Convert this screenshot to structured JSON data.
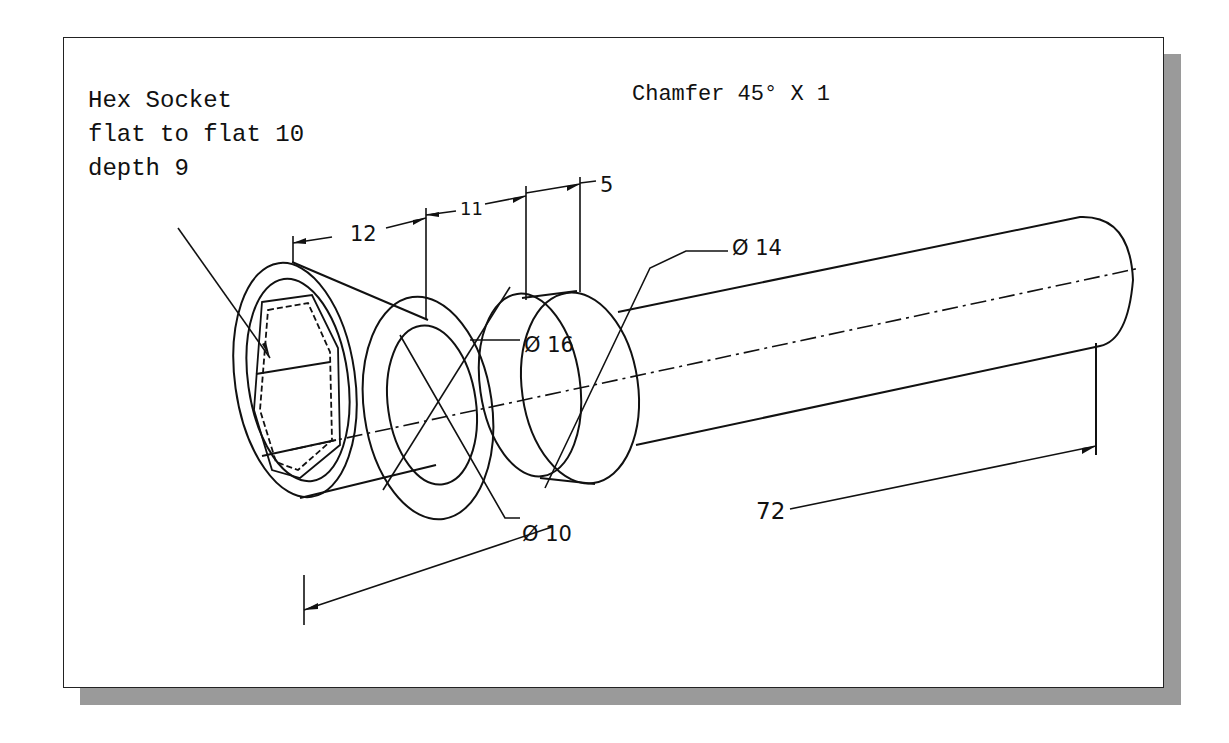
{
  "figure": {
    "type": "isometric engineering drawing",
    "colors": {
      "line": "#111111",
      "background": "#ffffff",
      "shadow": "#9a9a9a"
    }
  },
  "notes": {
    "hex_socket": {
      "line1": "Hex Socket",
      "line2": "flat to flat 10",
      "line3": "depth 9"
    },
    "chamfer": "Chamfer 45° X 1"
  },
  "dimensions": {
    "len_12": "12",
    "len_11": "11",
    "len_5": "5",
    "dia_14": "Ø 14",
    "dia_16": "Ø 16",
    "dia_10": "Ø 10",
    "overall_72": "72"
  }
}
